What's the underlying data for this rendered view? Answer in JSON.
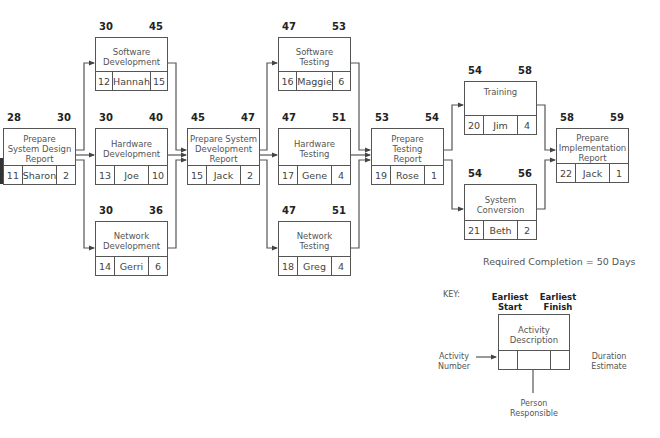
{
  "diagram": {
    "type": "network-diagram",
    "required_completion": "Required Completion = 50 Days",
    "nodes": [
      {
        "id": "11",
        "description": "Prepare System Design Report",
        "lines": [
          "Prepare",
          "System Design",
          "Report"
        ],
        "earliest_start": "28",
        "earliest_finish": "30",
        "activity_number": "11",
        "person": "Sharon",
        "duration": "2"
      },
      {
        "id": "12",
        "description": "Software Development",
        "lines": [
          "Software",
          "Development"
        ],
        "earliest_start": "30",
        "earliest_finish": "45",
        "activity_number": "12",
        "person": "Hannah",
        "duration": "15"
      },
      {
        "id": "13",
        "description": "Hardware Development",
        "lines": [
          "Hardware",
          "Development"
        ],
        "earliest_start": "30",
        "earliest_finish": "40",
        "activity_number": "13",
        "person": "Joe",
        "duration": "10"
      },
      {
        "id": "14",
        "description": "Network Development",
        "lines": [
          "Network",
          "Development"
        ],
        "earliest_start": "30",
        "earliest_finish": "36",
        "activity_number": "14",
        "person": "Gerri",
        "duration": "6"
      },
      {
        "id": "15",
        "description": "Prepare System Development Report",
        "lines": [
          "Prepare System",
          "Development",
          "Report"
        ],
        "earliest_start": "45",
        "earliest_finish": "47",
        "activity_number": "15",
        "person": "Jack",
        "duration": "2"
      },
      {
        "id": "16",
        "description": "Software Testing",
        "lines": [
          "Software",
          "Testing"
        ],
        "earliest_start": "47",
        "earliest_finish": "53",
        "activity_number": "16",
        "person": "Maggie",
        "duration": "6"
      },
      {
        "id": "17",
        "description": "Hardware Testing",
        "lines": [
          "Hardware",
          "Testing"
        ],
        "earliest_start": "47",
        "earliest_finish": "51",
        "activity_number": "17",
        "person": "Gene",
        "duration": "4"
      },
      {
        "id": "18",
        "description": "Network Testing",
        "lines": [
          "Network",
          "Testing"
        ],
        "earliest_start": "47",
        "earliest_finish": "51",
        "activity_number": "18",
        "person": "Greg",
        "duration": "4"
      },
      {
        "id": "19",
        "description": "Prepare Testing Report",
        "lines": [
          "Prepare",
          "Testing",
          "Report"
        ],
        "earliest_start": "53",
        "earliest_finish": "54",
        "activity_number": "19",
        "person": "Rose",
        "duration": "1"
      },
      {
        "id": "20",
        "description": "Training",
        "lines": [
          "Training"
        ],
        "earliest_start": "54",
        "earliest_finish": "58",
        "activity_number": "20",
        "person": "Jim",
        "duration": "4"
      },
      {
        "id": "21",
        "description": "System Conversion",
        "lines": [
          "System",
          "Conversion"
        ],
        "earliest_start": "54",
        "earliest_finish": "56",
        "activity_number": "21",
        "person": "Beth",
        "duration": "2"
      },
      {
        "id": "22",
        "description": "Prepare Implementation Report",
        "lines": [
          "Prepare",
          "Implementation",
          "Report"
        ],
        "earliest_start": "58",
        "earliest_finish": "59",
        "activity_number": "22",
        "person": "Jack",
        "duration": "1"
      }
    ],
    "edges": [
      [
        "11",
        "12"
      ],
      [
        "11",
        "13"
      ],
      [
        "11",
        "14"
      ],
      [
        "12",
        "15"
      ],
      [
        "13",
        "15"
      ],
      [
        "14",
        "15"
      ],
      [
        "15",
        "16"
      ],
      [
        "15",
        "17"
      ],
      [
        "15",
        "18"
      ],
      [
        "16",
        "19"
      ],
      [
        "17",
        "19"
      ],
      [
        "18",
        "19"
      ],
      [
        "19",
        "20"
      ],
      [
        "19",
        "21"
      ],
      [
        "20",
        "22"
      ],
      [
        "21",
        "22"
      ]
    ]
  },
  "key": {
    "title": "KEY:",
    "earliest_start": [
      "Earliest",
      "Start"
    ],
    "earliest_finish": [
      "Earliest",
      "Finish"
    ],
    "activity_description": [
      "Activity",
      "Description"
    ],
    "activity_number": [
      "Activity",
      "Number"
    ],
    "duration_estimate": [
      "Duration",
      "Estimate"
    ],
    "person_responsible": [
      "Person",
      "Responsible"
    ]
  }
}
